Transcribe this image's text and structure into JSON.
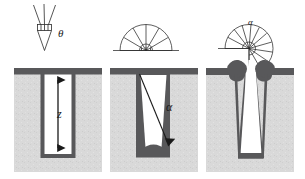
{
  "figure": {
    "background_color": "#ffffff",
    "substrate_color": "#d8d8d8",
    "film_color": "#58585a",
    "line_color": "#1a1a1a",
    "void_color": "#ffffff"
  },
  "panels": [
    {
      "id": "panel-directional",
      "index": 1,
      "caption": "",
      "source_diagram": {
        "name": "collimated-cone-source",
        "type": "narrow-cone",
        "angle_label": "θ",
        "ray_count": 3,
        "half_angle_deg": 12
      },
      "trench": {
        "profile": "vertical-straight-wall",
        "conformality": "conformal-thin-film",
        "depth_label": "z",
        "arrow": {
          "name": "depth-arrow",
          "type": "double-headed-vertical",
          "label": "z"
        }
      }
    },
    {
      "id": "panel-hemispherical",
      "index": 2,
      "caption": "",
      "source_diagram": {
        "name": "hemispherical-source",
        "type": "half-dome-fan",
        "angle_label": "",
        "ray_count": 9,
        "half_angle_deg": 90
      },
      "trench": {
        "profile": "tapered-walls",
        "conformality": "thicker-at-bottom",
        "depth_label": "",
        "arrow": {
          "name": "incidence-angle-arrow",
          "type": "single-headed-diagonal",
          "label": "α"
        }
      }
    },
    {
      "id": "panel-shadowed",
      "index": 3,
      "caption": "",
      "source_diagram": {
        "name": "rotated-fan-source",
        "type": "rotated-quarter-fan",
        "angle_label": "α",
        "ray_count": 10,
        "half_angle_deg": 90
      },
      "trench": {
        "profile": "tapered-walls-with-overhang",
        "conformality": "breadloafing-overhang-at-opening",
        "depth_label": "",
        "arrow": null
      }
    }
  ],
  "labels": {
    "theta": "θ",
    "z": "z",
    "alpha": "α",
    "alpha_small": "α"
  }
}
